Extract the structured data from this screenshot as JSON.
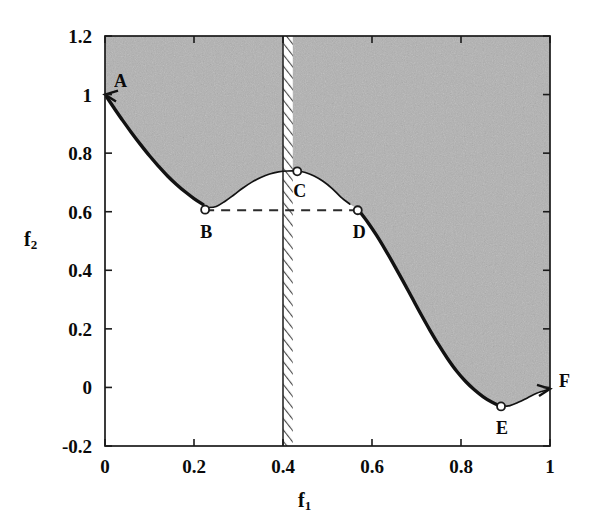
{
  "chart_data": {
    "type": "line",
    "title": "",
    "xlabel": "f1",
    "ylabel": "f2",
    "xlim": [
      0,
      1
    ],
    "ylim": [
      -0.2,
      1.2
    ],
    "grid": false,
    "legend": "none",
    "xticks": [
      "0",
      "0.2",
      "0.4",
      "0.6",
      "0.8",
      "1"
    ],
    "xtick_values": [
      0,
      0.2,
      0.4,
      0.6,
      0.8,
      1
    ],
    "yticks": [
      "1.2",
      "1",
      "0.8",
      "0.6",
      "0.4",
      "0.2",
      "0",
      "-0.2"
    ],
    "ytick_values": [
      1.2,
      1,
      0.8,
      0.6,
      0.4,
      0.2,
      0,
      -0.2
    ],
    "series": [
      {
        "name": "pareto-front-curve",
        "x": [
          0.0,
          0.02,
          0.04,
          0.06,
          0.08,
          0.1,
          0.12,
          0.14,
          0.16,
          0.18,
          0.2,
          0.22,
          0.23,
          0.25,
          0.27,
          0.29,
          0.31,
          0.33,
          0.35,
          0.37,
          0.39,
          0.41,
          0.43,
          0.45,
          0.47,
          0.49,
          0.51,
          0.53,
          0.55,
          0.57,
          0.59,
          0.61,
          0.63,
          0.65,
          0.67,
          0.69,
          0.71,
          0.73,
          0.75,
          0.77,
          0.79,
          0.81,
          0.83,
          0.85,
          0.87,
          0.89,
          0.91,
          0.93,
          0.95,
          0.97,
          1.0
        ],
        "y": [
          1.0,
          0.955,
          0.911,
          0.869,
          0.829,
          0.791,
          0.756,
          0.723,
          0.694,
          0.668,
          0.645,
          0.625,
          0.614,
          0.618,
          0.636,
          0.658,
          0.681,
          0.701,
          0.717,
          0.729,
          0.736,
          0.739,
          0.739,
          0.734,
          0.722,
          0.704,
          0.68,
          0.65,
          0.626,
          0.605,
          0.565,
          0.52,
          0.47,
          0.417,
          0.362,
          0.306,
          0.25,
          0.196,
          0.145,
          0.098,
          0.056,
          0.021,
          -0.008,
          -0.032,
          -0.051,
          -0.065,
          -0.062,
          -0.05,
          -0.035,
          -0.02,
          -0.005
        ]
      }
    ],
    "annotated_points": [
      {
        "id": "A",
        "x": 0.0,
        "y": 1.0,
        "label": "A",
        "label_dx": 9,
        "label_dy": -24
      },
      {
        "id": "B",
        "x": 0.225,
        "y": 0.607,
        "label": "B",
        "label_dx": -5,
        "label_dy": 12
      },
      {
        "id": "C",
        "x": 0.432,
        "y": 0.738,
        "label": "C",
        "label_dx": -4,
        "label_dy": 10
      },
      {
        "id": "D",
        "x": 0.568,
        "y": 0.605,
        "label": "D",
        "label_dx": -5,
        "label_dy": 12
      },
      {
        "id": "E",
        "x": 0.89,
        "y": -0.065,
        "label": "E",
        "label_dx": -5,
        "label_dy": 12
      },
      {
        "id": "F",
        "x": 1.0,
        "y": -0.005,
        "label": "F",
        "label_dx": 9,
        "label_dy": -18
      }
    ],
    "dashed_connector": {
      "from": "B",
      "to": "D",
      "y": 0.605,
      "style": "dashed"
    },
    "hatched_band": {
      "x_start": 0.4,
      "x_end": 0.422,
      "label": "infeasible-band",
      "hatch": "diagonal"
    },
    "shaded_region": {
      "description": "gray shaded feasible region above the curve",
      "color": "#b0b0b0"
    },
    "colors": {
      "curve": "#111111",
      "shade": "#b2b2b2",
      "axis": "#1a1a1a",
      "dashed": "#333333"
    }
  }
}
